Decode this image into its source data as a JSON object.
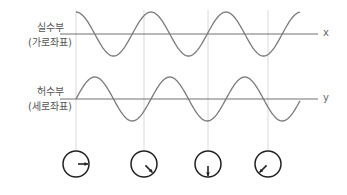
{
  "labels": {
    "real": {
      "title": "실수부",
      "sub": "(가로좌표)"
    },
    "imag": {
      "title": "허수부",
      "sub": "(세로좌표)"
    },
    "x_axis": "x",
    "y_axis": "y"
  },
  "diagram": {
    "curve_color": "#7a7a7a",
    "axis_color": "#707070",
    "guide_color": "#d8d8d8",
    "circle_color": "#222222",
    "start_x": 76,
    "end_x": 300,
    "period_px": 75,
    "amplitude_px": 22,
    "top_axis_y": 34,
    "bottom_axis_y": 99,
    "guides_x": [
      76,
      144,
      208,
      268
    ],
    "phasors": [
      {
        "cx": 76,
        "direction": "right"
      },
      {
        "cx": 144,
        "direction": "down-right"
      },
      {
        "cx": 208,
        "direction": "down"
      },
      {
        "cx": 268,
        "direction": "down-left"
      }
    ]
  }
}
